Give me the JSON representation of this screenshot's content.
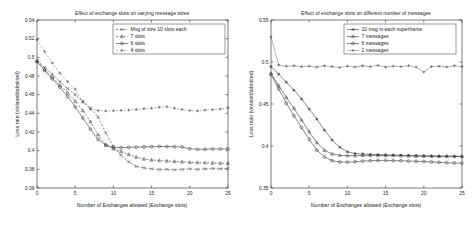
{
  "figure": {
    "panels": [
      "left",
      "right"
    ],
    "background_color": "#ffffff",
    "line_color": "#3a3a3a"
  },
  "chart_data": [
    {
      "id": "left",
      "type": "line",
      "title": "Effect of exchange slots on varying message sizes",
      "xlabel": "Number of Exchanges allowed (Exchange slots)",
      "ylabel": "Loss rate (violated/admitted)",
      "xlim": [
        0,
        25
      ],
      "ylim": [
        0.36,
        0.54
      ],
      "xticks": [
        0,
        5,
        10,
        15,
        20,
        25
      ],
      "xticklabels": [
        "0",
        "5",
        "10",
        "15",
        "20",
        "25"
      ],
      "yticks": [
        0.36,
        0.38,
        0.4,
        0.42,
        0.44,
        0.46,
        0.48,
        0.5,
        0.52,
        0.54
      ],
      "yticklabels": [
        "0.36",
        "0.38",
        "0.4",
        "0.42",
        "0.44",
        "0.46",
        "0.48",
        "0.5",
        "0.52",
        "0.54"
      ],
      "grid": false,
      "legend_position": "upper right",
      "x": [
        0,
        1,
        2,
        3,
        4,
        5,
        6,
        7,
        8,
        9,
        10,
        11,
        12,
        13,
        14,
        15,
        16,
        17,
        18,
        19,
        20,
        21,
        22,
        23,
        24,
        25
      ],
      "series": [
        {
          "name": "Msg of size 10 slots each",
          "marker": "x",
          "linestyle": "dotted",
          "values": [
            0.4965,
            0.4895,
            0.482,
            0.474,
            0.4665,
            0.46,
            0.453,
            0.4455,
            0.436,
            0.419,
            0.4045,
            0.395,
            0.388,
            0.383,
            0.3815,
            0.3805,
            0.3798,
            0.38,
            0.3795,
            0.38,
            0.3805,
            0.38,
            0.3805,
            0.3808,
            0.3805,
            0.381
          ]
        },
        {
          "name": "7 slots",
          "marker": "triangle",
          "linestyle": "dashed",
          "values": [
            0.496,
            0.487,
            0.479,
            0.47,
            0.462,
            0.453,
            0.443,
            0.431,
            0.417,
            0.406,
            0.402,
            0.399,
            0.396,
            0.393,
            0.391,
            0.39,
            0.3895,
            0.389,
            0.3885,
            0.388,
            0.3875,
            0.3873,
            0.387,
            0.3868,
            0.3866,
            0.3865
          ]
        },
        {
          "name": "6 slots",
          "marker": "circle",
          "linestyle": "solid",
          "values": [
            0.4955,
            0.486,
            0.477,
            0.468,
            0.458,
            0.447,
            0.435,
            0.423,
            0.412,
            0.406,
            0.4035,
            0.4032,
            0.4035,
            0.4038,
            0.404,
            0.4042,
            0.4045,
            0.4044,
            0.4042,
            0.404,
            0.402,
            0.4015,
            0.4015,
            0.4018,
            0.4018,
            0.402
          ]
        },
        {
          "name": "4 slots",
          "marker": "plus",
          "linestyle": "dashdot",
          "values": [
            0.519,
            0.506,
            0.494,
            0.483,
            0.474,
            0.466,
            0.452,
            0.4448,
            0.443,
            0.4425,
            0.4428,
            0.4432,
            0.4435,
            0.444,
            0.445,
            0.4455,
            0.4465,
            0.447,
            0.4455,
            0.444,
            0.443,
            0.4425,
            0.4435,
            0.444,
            0.4445,
            0.446
          ]
        }
      ]
    },
    {
      "id": "right",
      "type": "line",
      "title": "Effect of exchange slots on different number of messages",
      "xlabel": "Number of Exchanges allowed (Exchange slots)",
      "ylabel": "Loss ratio (violated/admitted)",
      "xlim": [
        0,
        25
      ],
      "ylim": [
        0.35,
        0.55
      ],
      "xticks": [
        0,
        5,
        10,
        15,
        20,
        25
      ],
      "xticklabels": [
        "0",
        "5",
        "10",
        "15",
        "20",
        "25"
      ],
      "yticks": [
        0.35,
        0.4,
        0.45,
        0.5,
        0.55
      ],
      "yticklabels": [
        "0.35",
        "0.4",
        "0.45",
        "0.5",
        "0.55"
      ],
      "grid": false,
      "legend_position": "upper right",
      "x": [
        0,
        1,
        2,
        3,
        4,
        5,
        6,
        7,
        8,
        9,
        10,
        11,
        12,
        13,
        14,
        15,
        16,
        17,
        18,
        19,
        20,
        21,
        22,
        23,
        24,
        25
      ],
      "series": [
        {
          "name": "10 msg in each superframe",
          "marker": "star",
          "linestyle": "solid",
          "values": [
            0.4945,
            0.4855,
            0.476,
            0.4665,
            0.456,
            0.444,
            0.432,
            0.419,
            0.407,
            0.3985,
            0.393,
            0.391,
            0.3905,
            0.39,
            0.3898,
            0.3895,
            0.3893,
            0.389,
            0.3888,
            0.3885,
            0.3883,
            0.3882,
            0.388,
            0.388,
            0.3878,
            0.3878
          ]
        },
        {
          "name": "7 messages",
          "marker": "triangle",
          "linestyle": "solid",
          "values": [
            0.486,
            0.472,
            0.458,
            0.445,
            0.431,
            0.417,
            0.404,
            0.395,
            0.3905,
            0.389,
            0.3885,
            0.3885,
            0.3888,
            0.3888,
            0.3888,
            0.3886,
            0.3886,
            0.3884,
            0.3882,
            0.388,
            0.3879,
            0.3878,
            0.3877,
            0.3876,
            0.3876,
            0.3875
          ]
        },
        {
          "name": "6 messages",
          "marker": "circle",
          "linestyle": "solid",
          "values": [
            0.4855,
            0.468,
            0.451,
            0.436,
            0.422,
            0.408,
            0.395,
            0.387,
            0.3825,
            0.381,
            0.3808,
            0.3812,
            0.382,
            0.3825,
            0.3828,
            0.3828,
            0.3826,
            0.3824,
            0.382,
            0.3818,
            0.3815,
            0.381,
            0.3805,
            0.38,
            0.3798,
            0.3795
          ]
        },
        {
          "name": "2 messages",
          "marker": "plus",
          "linestyle": "solid",
          "values": [
            0.53,
            0.4965,
            0.495,
            0.4955,
            0.4945,
            0.495,
            0.494,
            0.4955,
            0.4945,
            0.4935,
            0.495,
            0.494,
            0.4955,
            0.4945,
            0.496,
            0.494,
            0.495,
            0.4945,
            0.4955,
            0.494,
            0.488,
            0.4945,
            0.495,
            0.494,
            0.4955,
            0.4945
          ]
        }
      ]
    }
  ]
}
